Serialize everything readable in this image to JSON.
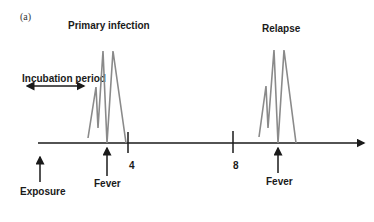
{
  "panel_label": "(a)",
  "labels": {
    "primary_infection": "Primary infection",
    "relapse": "Relapse",
    "incubation_period": "Incubation period",
    "exposure": "Exposure",
    "fever_primary": "Fever",
    "fever_relapse": "Fever"
  },
  "axis": {
    "ticks": [
      "4",
      "8"
    ]
  },
  "colors": {
    "axis": "#1a1a1a",
    "peaks": "#8a8a8a"
  }
}
